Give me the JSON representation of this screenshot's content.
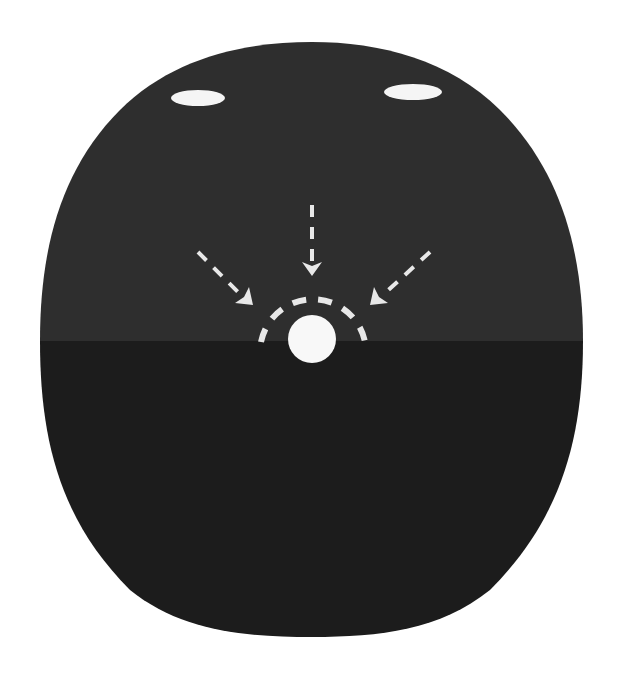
{
  "diagram": {
    "title": "",
    "background": "#ffffff",
    "body": {
      "shape": "rounded-circle",
      "upper_color": "#2e2e2e",
      "lower_color": "#1c1c1c",
      "divider_y": 341,
      "bounds": {
        "left": 40,
        "right": 583,
        "top": 42,
        "bottom": 637
      }
    },
    "top_ellipses": [
      {
        "cx": 198,
        "cy": 98,
        "rx": 27,
        "ry": 8,
        "color": "#f5f5f5"
      },
      {
        "cx": 413,
        "cy": 92,
        "rx": 29,
        "ry": 8,
        "color": "#f5f5f5"
      }
    ],
    "center_dot": {
      "cx": 312,
      "cy": 339,
      "r": 24,
      "color": "#f8f8f8"
    },
    "dashed_arc": {
      "cx": 312,
      "cy": 340,
      "r": 53,
      "color": "#e8e8e8"
    },
    "arrows": [
      {
        "name": "arrow-top",
        "from": [
          312,
          205
        ],
        "to": [
          312,
          274
        ]
      },
      {
        "name": "arrow-left",
        "from": [
          198,
          252
        ],
        "to": [
          250,
          302
        ]
      },
      {
        "name": "arrow-right",
        "from": [
          430,
          252
        ],
        "to": [
          373,
          302
        ]
      }
    ],
    "labels": []
  }
}
